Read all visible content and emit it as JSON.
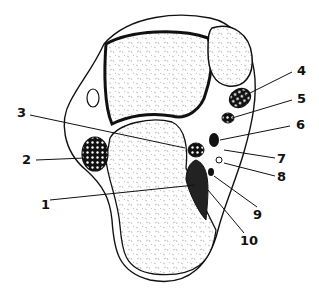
{
  "figure": {
    "type": "anatomical cross-section line drawing",
    "labels": [
      {
        "id": "1",
        "text": "1",
        "x": 41,
        "y": 198
      },
      {
        "id": "2",
        "text": "2",
        "x": 22,
        "y": 153
      },
      {
        "id": "3",
        "text": "3",
        "x": 17,
        "y": 111
      },
      {
        "id": "4",
        "text": "4",
        "x": 297,
        "y": 67
      },
      {
        "id": "5",
        "text": "5",
        "x": 297,
        "y": 95
      },
      {
        "id": "6",
        "text": "6",
        "x": 296,
        "y": 121
      },
      {
        "id": "7",
        "text": "7",
        "x": 277,
        "y": 153
      },
      {
        "id": "8",
        "text": "8",
        "x": 277,
        "y": 172
      },
      {
        "id": "9",
        "text": "9",
        "x": 253,
        "y": 211
      },
      {
        "id": "10",
        "text": "10",
        "x": 240,
        "y": 237
      }
    ],
    "colors": {
      "ink": "#111111",
      "background": "#ffffff",
      "stipple": "#888888"
    }
  }
}
